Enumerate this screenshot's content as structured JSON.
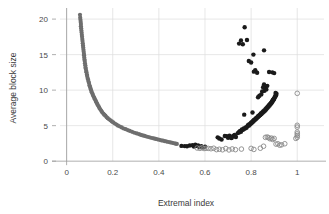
{
  "chart_data": {
    "type": "scatter",
    "title": "",
    "xlabel": "Extremal index",
    "ylabel": "Average block size",
    "xlim": [
      -0.02,
      1.09
    ],
    "ylim": [
      -0.4,
      21.0
    ],
    "xticks": [
      0,
      0.2,
      0.4,
      0.6,
      0.8,
      1
    ],
    "xtick_labels": [
      "0",
      "0.2",
      "0.4",
      "0.6",
      "0.8",
      "1"
    ],
    "yticks": [
      0,
      5,
      10,
      15,
      20
    ],
    "ytick_labels": [
      "0",
      "5",
      "10",
      "15",
      "20"
    ],
    "grid": true,
    "grid_color": "#dcdcdc",
    "legend": "none",
    "series": [
      {
        "name": "gray-decay-curve",
        "marker": "filled-circle",
        "color": "#6e6e6e",
        "size": 2.1,
        "points": [
          [
            0.058,
            20.6
          ],
          [
            0.059,
            20.2
          ],
          [
            0.06,
            19.9
          ],
          [
            0.061,
            19.6
          ],
          [
            0.062,
            19.3
          ],
          [
            0.062,
            19.0
          ],
          [
            0.063,
            18.7
          ],
          [
            0.064,
            18.4
          ],
          [
            0.065,
            18.1
          ],
          [
            0.066,
            17.8
          ],
          [
            0.067,
            17.5
          ],
          [
            0.068,
            17.2
          ],
          [
            0.069,
            16.9
          ],
          [
            0.07,
            16.6
          ],
          [
            0.071,
            16.3
          ],
          [
            0.072,
            16.0
          ],
          [
            0.073,
            15.7
          ],
          [
            0.074,
            15.4
          ],
          [
            0.075,
            15.1
          ],
          [
            0.0755,
            14.9
          ],
          [
            0.0765,
            14.6
          ],
          [
            0.0775,
            14.3
          ],
          [
            0.0785,
            14.1
          ],
          [
            0.0795,
            13.8
          ],
          [
            0.081,
            13.5
          ],
          [
            0.082,
            13.2
          ],
          [
            0.083,
            13.0
          ],
          [
            0.085,
            12.7
          ],
          [
            0.086,
            12.5
          ],
          [
            0.088,
            12.2
          ],
          [
            0.089,
            12.0
          ],
          [
            0.091,
            11.7
          ],
          [
            0.093,
            11.5
          ],
          [
            0.095,
            11.2
          ],
          [
            0.097,
            11.0
          ],
          [
            0.099,
            10.7
          ],
          [
            0.101,
            10.5
          ],
          [
            0.103,
            10.3
          ],
          [
            0.105,
            10.1
          ],
          [
            0.107,
            9.9
          ],
          [
            0.109,
            9.7
          ],
          [
            0.112,
            9.5
          ],
          [
            0.114,
            9.3
          ],
          [
            0.117,
            9.1
          ],
          [
            0.12,
            8.9
          ],
          [
            0.123,
            8.7
          ],
          [
            0.126,
            8.5
          ],
          [
            0.129,
            8.3
          ],
          [
            0.132,
            8.1
          ],
          [
            0.135,
            7.9
          ],
          [
            0.139,
            7.7
          ],
          [
            0.142,
            7.5
          ],
          [
            0.146,
            7.3
          ],
          [
            0.15,
            7.1
          ],
          [
            0.154,
            6.9
          ],
          [
            0.159,
            6.7
          ],
          [
            0.163,
            6.55
          ],
          [
            0.168,
            6.4
          ],
          [
            0.173,
            6.2
          ],
          [
            0.178,
            6.05
          ],
          [
            0.184,
            5.9
          ],
          [
            0.19,
            5.75
          ],
          [
            0.196,
            5.6
          ],
          [
            0.202,
            5.45
          ],
          [
            0.209,
            5.3
          ],
          [
            0.216,
            5.15
          ],
          [
            0.223,
            5.0
          ],
          [
            0.231,
            4.88
          ],
          [
            0.239,
            4.75
          ],
          [
            0.247,
            4.6
          ],
          [
            0.256,
            4.5
          ],
          [
            0.265,
            4.38
          ],
          [
            0.274,
            4.25
          ],
          [
            0.284,
            4.13
          ],
          [
            0.294,
            4.0
          ],
          [
            0.304,
            3.9
          ],
          [
            0.314,
            3.8
          ],
          [
            0.322,
            3.7
          ],
          [
            0.33,
            3.62
          ],
          [
            0.338,
            3.55
          ],
          [
            0.346,
            3.47
          ],
          [
            0.354,
            3.4
          ],
          [
            0.362,
            3.33
          ],
          [
            0.37,
            3.26
          ],
          [
            0.378,
            3.2
          ],
          [
            0.386,
            3.13
          ],
          [
            0.394,
            3.07
          ],
          [
            0.402,
            3.0
          ],
          [
            0.41,
            2.94
          ],
          [
            0.418,
            2.88
          ],
          [
            0.426,
            2.82
          ],
          [
            0.434,
            2.76
          ],
          [
            0.442,
            2.7
          ],
          [
            0.45,
            2.64
          ],
          [
            0.458,
            2.58
          ],
          [
            0.466,
            2.52
          ],
          [
            0.472,
            2.46
          ],
          [
            0.478,
            2.42
          ]
        ]
      },
      {
        "name": "black-filled-points",
        "marker": "filled-circle",
        "color": "#1a1a1a",
        "size": 2.2,
        "points": [
          [
            0.498,
            2.15
          ],
          [
            0.512,
            2.12
          ],
          [
            0.522,
            2.1
          ],
          [
            0.534,
            2.2
          ],
          [
            0.546,
            2.25
          ],
          [
            0.552,
            2.05
          ],
          [
            0.558,
            2.3
          ],
          [
            0.564,
            2.15
          ],
          [
            0.57,
            2.22
          ],
          [
            0.576,
            2.0
          ],
          [
            0.584,
            2.1
          ],
          [
            0.592,
            1.95
          ],
          [
            0.6,
            2.05
          ],
          [
            0.655,
            3.35
          ],
          [
            0.662,
            3.2
          ],
          [
            0.672,
            3.05
          ],
          [
            0.686,
            3.55
          ],
          [
            0.694,
            3.5
          ],
          [
            0.7,
            3.3
          ],
          [
            0.706,
            3.6
          ],
          [
            0.714,
            3.25
          ],
          [
            0.722,
            3.55
          ],
          [
            0.728,
            3.7
          ],
          [
            0.734,
            3.4
          ],
          [
            0.742,
            3.95
          ],
          [
            0.748,
            4.05
          ],
          [
            0.752,
            4.25
          ],
          [
            0.756,
            4.15
          ],
          [
            0.76,
            4.45
          ],
          [
            0.764,
            4.4
          ],
          [
            0.768,
            4.6
          ],
          [
            0.772,
            4.55
          ],
          [
            0.776,
            4.75
          ],
          [
            0.78,
            4.7
          ],
          [
            0.784,
            4.9
          ],
          [
            0.786,
            5.05
          ],
          [
            0.79,
            5.0
          ],
          [
            0.792,
            5.2
          ],
          [
            0.795,
            5.15
          ],
          [
            0.798,
            5.35
          ],
          [
            0.8,
            5.3
          ],
          [
            0.802,
            5.5
          ],
          [
            0.805,
            5.45
          ],
          [
            0.808,
            5.65
          ],
          [
            0.81,
            5.6
          ],
          [
            0.812,
            5.8
          ],
          [
            0.815,
            5.75
          ],
          [
            0.818,
            5.95
          ],
          [
            0.82,
            5.9
          ],
          [
            0.822,
            6.1
          ],
          [
            0.825,
            6.05
          ],
          [
            0.828,
            6.25
          ],
          [
            0.83,
            6.2
          ],
          [
            0.832,
            6.4
          ],
          [
            0.835,
            6.35
          ],
          [
            0.838,
            6.55
          ],
          [
            0.84,
            6.5
          ],
          [
            0.842,
            6.7
          ],
          [
            0.845,
            6.65
          ],
          [
            0.848,
            6.85
          ],
          [
            0.85,
            6.8
          ],
          [
            0.852,
            7.0
          ],
          [
            0.855,
            6.95
          ],
          [
            0.857,
            7.15
          ],
          [
            0.86,
            7.1
          ],
          [
            0.862,
            7.3
          ],
          [
            0.864,
            7.25
          ],
          [
            0.866,
            7.45
          ],
          [
            0.868,
            7.4
          ],
          [
            0.87,
            7.6
          ],
          [
            0.872,
            7.55
          ],
          [
            0.874,
            7.75
          ],
          [
            0.876,
            7.7
          ],
          [
            0.878,
            7.9
          ],
          [
            0.88,
            7.85
          ],
          [
            0.882,
            8.05
          ],
          [
            0.884,
            8.0
          ],
          [
            0.886,
            8.2
          ],
          [
            0.888,
            8.15
          ],
          [
            0.89,
            8.4
          ],
          [
            0.892,
            8.35
          ],
          [
            0.894,
            8.6
          ],
          [
            0.896,
            8.55
          ],
          [
            0.898,
            8.8
          ],
          [
            0.9,
            8.75
          ],
          [
            0.902,
            9.0
          ],
          [
            0.904,
            9.05
          ],
          [
            0.906,
            9.3
          ],
          [
            0.908,
            9.25
          ],
          [
            0.91,
            9.5
          ],
          [
            0.906,
            9.6
          ],
          [
            0.858,
            9.9
          ],
          [
            0.862,
            10.3
          ],
          [
            0.866,
            10.1
          ],
          [
            0.87,
            10.6
          ],
          [
            0.856,
            10.8
          ],
          [
            0.852,
            10.4
          ],
          [
            0.848,
            9.8
          ],
          [
            0.844,
            9.4
          ],
          [
            0.836,
            9.2
          ],
          [
            0.83,
            9.0
          ],
          [
            0.826,
            12.45
          ],
          [
            0.818,
            12.8
          ],
          [
            0.812,
            12.6
          ],
          [
            0.878,
            12.55
          ],
          [
            0.892,
            12.5
          ],
          [
            0.9,
            12.4
          ],
          [
            0.856,
            15.6
          ],
          [
            0.81,
            15.0
          ],
          [
            0.772,
            18.85
          ],
          [
            0.756,
            17.0
          ],
          [
            0.782,
            17.05
          ],
          [
            0.748,
            16.55
          ],
          [
            0.764,
            16.45
          ],
          [
            0.8,
            13.9
          ],
          [
            0.79,
            14.1
          ],
          [
            0.806,
            6.85
          ],
          [
            0.77,
            6.55
          ],
          [
            0.748,
            4.1
          ],
          [
            0.73,
            3.5
          ],
          [
            0.716,
            3.3
          ]
        ]
      },
      {
        "name": "hollow-circle-points",
        "marker": "open-circle",
        "color": "#8a8a8a",
        "size": 2.3,
        "points": [
          [
            0.566,
            1.85
          ],
          [
            0.578,
            1.8
          ],
          [
            0.588,
            1.9
          ],
          [
            0.596,
            1.78
          ],
          [
            0.604,
            1.82
          ],
          [
            0.614,
            1.8
          ],
          [
            0.626,
            1.75
          ],
          [
            0.638,
            1.82
          ],
          [
            0.65,
            1.62
          ],
          [
            0.662,
            1.68
          ],
          [
            0.676,
            1.6
          ],
          [
            0.69,
            1.78
          ],
          [
            0.704,
            1.58
          ],
          [
            0.718,
            1.72
          ],
          [
            0.732,
            1.62
          ],
          [
            0.758,
            1.7
          ],
          [
            0.8,
            1.8
          ],
          [
            0.812,
            1.65
          ],
          [
            0.84,
            1.82
          ],
          [
            0.854,
            2.1
          ],
          [
            0.862,
            3.35
          ],
          [
            0.87,
            3.4
          ],
          [
            0.876,
            3.3
          ],
          [
            0.882,
            3.15
          ],
          [
            0.888,
            3.25
          ],
          [
            0.894,
            3.05
          ],
          [
            0.9,
            3.2
          ],
          [
            0.908,
            2.4
          ],
          [
            0.916,
            2.45
          ],
          [
            0.924,
            2.25
          ],
          [
            0.932,
            2.3
          ],
          [
            0.946,
            2.45
          ],
          [
            1.0,
            9.55
          ],
          [
            1.0,
            5.05
          ],
          [
            1.0,
            4.8
          ],
          [
            1.0,
            4.1
          ],
          [
            1.0,
            3.85
          ],
          [
            1.0,
            3.6
          ],
          [
            1.0,
            3.35
          ],
          [
            0.994,
            3.2
          ]
        ]
      }
    ]
  },
  "axes": {
    "xlabel": "Extremal index",
    "ylabel": "Average block size",
    "xtick_labels": [
      "0",
      "0.2",
      "0.4",
      "0.6",
      "0.8",
      "1"
    ],
    "ytick_labels": [
      "0",
      "5",
      "10",
      "15",
      "20"
    ]
  }
}
